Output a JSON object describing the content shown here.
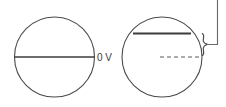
{
  "figure": {
    "background_color": "#ffffff",
    "stroke_color": "#4a4a4a",
    "chord_color": "#3c3c3c",
    "width": 226,
    "height": 107
  },
  "labels": {
    "zero_volts": "0 V"
  },
  "left_circle": {
    "name": "left-circle",
    "center_x": 54.5,
    "center_y": 57,
    "radius": 40,
    "center_line": {
      "name": "left-circle-center-line",
      "x1": 14.5,
      "y1": 57,
      "x2": 94.5,
      "y2": 57,
      "style": "solid"
    }
  },
  "right_circle": {
    "name": "right-circle",
    "center_x": 162,
    "center_y": 57,
    "radius": 40,
    "offset_line": {
      "name": "right-circle-offset-line",
      "x1": 133,
      "y1": 33.5,
      "x2": 191,
      "y2": 33.5,
      "style": "solid"
    },
    "center_dashed_line": {
      "name": "right-circle-center-dashed-line",
      "x1": 160,
      "y1": 57,
      "x2": 201,
      "y2": 57,
      "style": "dashed"
    }
  },
  "brace": {
    "name": "offset-brace",
    "top_y": 33.5,
    "bottom_y": 57,
    "tip_x": 207.5,
    "spine_x": 203
  },
  "leader": {
    "name": "leader-line",
    "horizontal": {
      "x1": 207.5,
      "y1": 44.5,
      "x2": 217.5,
      "y2": 44.5
    },
    "vertical": {
      "x1": 217.5,
      "y1": 44.5,
      "x2": 217.5,
      "y2": 0
    }
  }
}
